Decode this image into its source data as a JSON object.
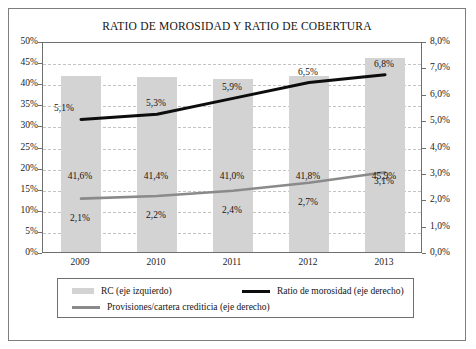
{
  "figure": {
    "title": "RATIO DE MOROSIDAD Y RATIO DE COBERTURA",
    "colors": {
      "bar": "#d3d3d3",
      "line_morosidad": "#0d0d0d",
      "line_provisiones": "#8a8a8a",
      "frame": "#6f6f6f",
      "gridline": "#c3c3c3",
      "background": "#ffffff"
    }
  },
  "chart_data": {
    "type": "bar",
    "title": "RATIO DE MOROSIDAD Y RATIO DE COBERTURA",
    "xlabel": "",
    "ylabel": "",
    "categories": [
      "2009",
      "2010",
      "2011",
      "2012",
      "2013"
    ],
    "grid": true,
    "legend_position": "bottom",
    "axes": {
      "left": {
        "label": "",
        "ylim": [
          0,
          50
        ],
        "tick_step": 5,
        "ticks": [
          "0%",
          "5%",
          "10%",
          "15%",
          "20%",
          "25%",
          "30%",
          "35%",
          "40%",
          "45%",
          "50%"
        ],
        "tick_values": [
          0,
          5,
          10,
          15,
          20,
          25,
          30,
          35,
          40,
          45,
          50
        ]
      },
      "right": {
        "label": "",
        "ylim": [
          0,
          8
        ],
        "tick_step": 1,
        "ticks": [
          "0,0%",
          "1,0%",
          "2,0%",
          "3,0%",
          "4,0%",
          "5,0%",
          "6,0%",
          "7,0%",
          "8,0%"
        ],
        "tick_values": [
          0,
          1,
          2,
          3,
          4,
          5,
          6,
          7,
          8
        ]
      }
    },
    "series": [
      {
        "name": "RC (eje izquierdo)",
        "type": "bar",
        "axis": "left",
        "values": [
          41.6,
          41.4,
          41.0,
          41.8,
          45.9
        ],
        "labels": [
          "41,6%",
          "41,4%",
          "41,0%",
          "41,8%",
          "45,9%"
        ]
      },
      {
        "name": "Ratio de morosidad (eje derecho)",
        "type": "line",
        "axis": "right",
        "values": [
          5.1,
          5.3,
          5.9,
          6.5,
          6.8
        ],
        "labels": [
          "5,1%",
          "5,3%",
          "5,9%",
          "6,5%",
          "6,8%"
        ]
      },
      {
        "name": "Provisiones/cartera crediticia (eje derecho)",
        "type": "line",
        "axis": "right",
        "values": [
          2.1,
          2.2,
          2.4,
          2.7,
          3.1
        ],
        "labels": [
          "2,1%",
          "2,2%",
          "2,4%",
          "2,7%",
          "3,1%"
        ]
      }
    ]
  },
  "legend": {
    "items": [
      "RC (eje izquierdo)",
      "Ratio de morosidad (eje derecho)",
      "Provisiones/cartera crediticia (eje derecho)"
    ]
  }
}
